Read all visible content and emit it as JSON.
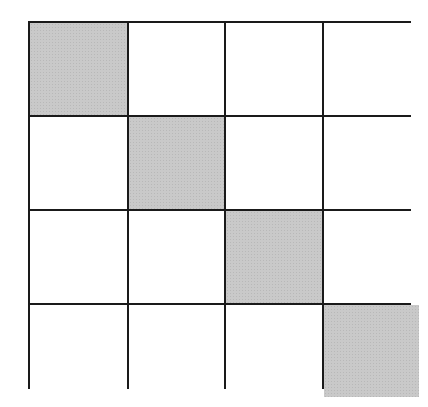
{
  "diagram": {
    "type": "grid",
    "rows": 4,
    "cols": 4,
    "shaded_color": "#c9c9c9",
    "line_color": "#1a1a1a",
    "cells": [
      [
        true,
        false,
        false,
        false
      ],
      [
        false,
        true,
        false,
        false
      ],
      [
        false,
        false,
        true,
        false
      ],
      [
        false,
        false,
        false,
        true
      ]
    ]
  }
}
